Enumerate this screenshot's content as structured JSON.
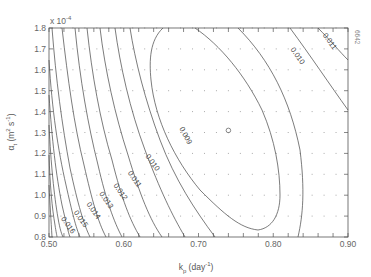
{
  "chart_data": {
    "type": "contour",
    "title": "",
    "xlabel": "k_p (day^-1)",
    "xlabel_main": "k",
    "xlabel_sub": "p",
    "xlabel_unit": "(day",
    "xlabel_unit_sup": "-1",
    "xlabel_unit_close": ")",
    "ylabel": "α_t (m² s⁻¹)",
    "ylabel_main": "α",
    "ylabel_sub": "t",
    "ylabel_unit": "(m",
    "ylabel_unit_sup1": "2",
    "ylabel_unit_mid": " s",
    "ylabel_unit_sup2": "-1",
    "ylabel_unit_close": ")",
    "y_multiplier": "x 10",
    "y_multiplier_exp": "-4",
    "xlim": [
      0.5,
      0.9
    ],
    "ylim": [
      0.8,
      1.8
    ],
    "x_ticks": [
      "0.50",
      "0.60",
      "0.70",
      "0.80",
      "0.90"
    ],
    "y_ticks": [
      "0.8",
      "0.9",
      "1.0",
      "1.1",
      "1.2",
      "1.3",
      "1.4",
      "1.5",
      "1.6",
      "1.7",
      "1.8"
    ],
    "contour_levels": [
      0.009,
      0.01,
      0.011,
      0.012,
      0.013,
      0.014,
      0.015,
      0.016
    ],
    "contour_labels": [
      {
        "text": "0.009",
        "x": 0.68,
        "y": 1.28,
        "angle": 62
      },
      {
        "text": "0.010",
        "x": 0.636,
        "y": 1.15,
        "angle": 55
      },
      {
        "text": "0.011",
        "x": 0.612,
        "y": 1.07,
        "angle": 55
      },
      {
        "text": "0.012",
        "x": 0.593,
        "y": 1.01,
        "angle": 55
      },
      {
        "text": "0.013",
        "x": 0.574,
        "y": 0.97,
        "angle": 55
      },
      {
        "text": "0.014",
        "x": 0.557,
        "y": 0.92,
        "angle": 55
      },
      {
        "text": "0.015",
        "x": 0.54,
        "y": 0.88,
        "angle": 55
      },
      {
        "text": "0.016",
        "x": 0.523,
        "y": 0.85,
        "angle": 55
      },
      {
        "text": "0.010",
        "x": 0.83,
        "y": 1.66,
        "angle": 55
      },
      {
        "text": "0.011",
        "x": 0.873,
        "y": 1.73,
        "angle": 55
      }
    ],
    "optimum": {
      "x": 0.74,
      "y": 1.31,
      "marker": "circle"
    },
    "grid": "dotted sample points",
    "figure_id": "6642"
  }
}
